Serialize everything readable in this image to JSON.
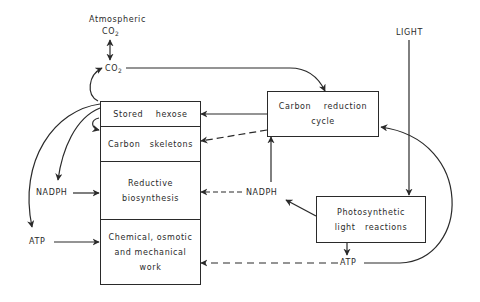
{
  "diagram": {
    "title": "",
    "labels": {
      "atmospheric": "Atmospheric",
      "atm_co2": "CO",
      "atm_co2_sub": "2",
      "co2": "CO",
      "co2_sub": "2",
      "light": "LIGHT",
      "nadph_left": "NADPH",
      "atp_left": "ATP",
      "nadph_mid": "NADPH",
      "atp_bottom": "ATP"
    },
    "main_box": {
      "cells": [
        {
          "lines": [
            "Stored    hexose"
          ]
        },
        {
          "lines": [
            "Carbon   skeletons"
          ]
        },
        {
          "lines": [
            "Reductive",
            "biosynthesis"
          ]
        },
        {
          "lines": [
            "Chemical, osmotic",
            "and mechanical",
            "work"
          ]
        }
      ]
    },
    "carbon_reduction_box": {
      "lines": [
        "Carbon    reduction",
        "cycle"
      ]
    },
    "light_reactions_box": {
      "lines": [
        "Photosynthetic",
        "light   reactions"
      ]
    },
    "edges": [
      {
        "from": "Atmospheric CO2",
        "to": "CO2",
        "style": "solid",
        "bidirectional": true
      },
      {
        "from": "CO2",
        "to": "Carbon reduction cycle",
        "style": "solid"
      },
      {
        "from": "Stored hexose",
        "to": "CO2",
        "style": "solid"
      },
      {
        "from": "Carbon reduction cycle",
        "to": "Stored hexose",
        "style": "solid"
      },
      {
        "from": "Carbon reduction cycle",
        "to": "Carbon skeletons",
        "style": "dashed"
      },
      {
        "from": "Stored hexose",
        "to": "Carbon skeletons",
        "style": "solid"
      },
      {
        "from": "Stored hexose",
        "to": "NADPH (left)",
        "style": "solid"
      },
      {
        "from": "Stored hexose",
        "to": "ATP (left)",
        "style": "solid"
      },
      {
        "from": "NADPH (left)",
        "to": "Reductive biosynthesis",
        "style": "solid"
      },
      {
        "from": "ATP (left)",
        "to": "Chemical, osmotic and mechanical work",
        "style": "solid"
      },
      {
        "from": "LIGHT",
        "to": "Photosynthetic light reactions",
        "style": "solid"
      },
      {
        "from": "Photosynthetic light reactions",
        "to": "NADPH (mid)",
        "style": "solid"
      },
      {
        "from": "Photosynthetic light reactions",
        "to": "ATP (bottom)",
        "style": "solid"
      },
      {
        "from": "NADPH (mid)",
        "to": "Carbon reduction cycle",
        "style": "solid"
      },
      {
        "from": "NADPH (mid)",
        "to": "Reductive biosynthesis",
        "style": "dashed"
      },
      {
        "from": "ATP (bottom)",
        "to": "Chemical, osmotic and mechanical work",
        "style": "dashed"
      },
      {
        "from": "ATP (bottom)",
        "to": "Carbon reduction cycle",
        "style": "solid"
      }
    ],
    "colors": {
      "ink": "#2a2a2a",
      "background": "#ffffff"
    }
  }
}
